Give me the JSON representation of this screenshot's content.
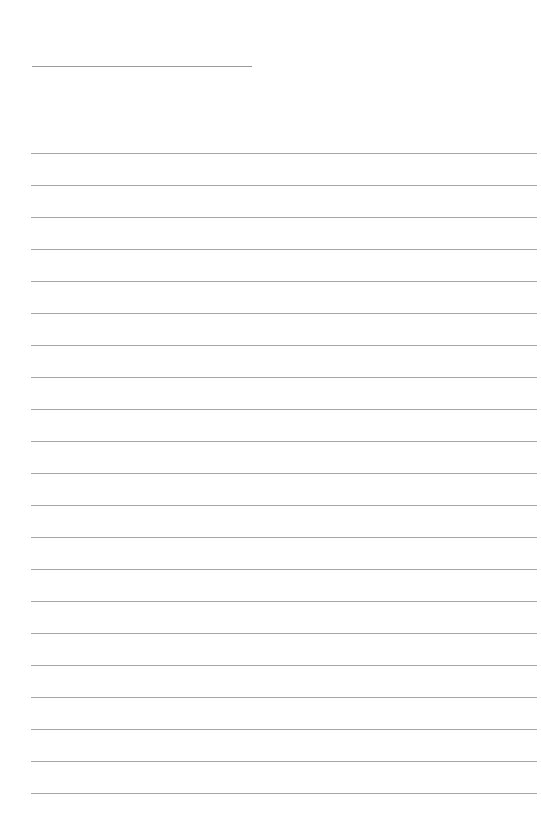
{
  "page": {
    "type": "lined-paper",
    "background": "#ffffff",
    "line_color": "#a6a6a6"
  },
  "title_line": {
    "x": 32,
    "y": 66,
    "width": 220,
    "color": "#9a9a9a"
  },
  "ruled_lines": {
    "x": 31,
    "width": 506,
    "first_y": 153,
    "spacing": 32,
    "count": 21
  }
}
